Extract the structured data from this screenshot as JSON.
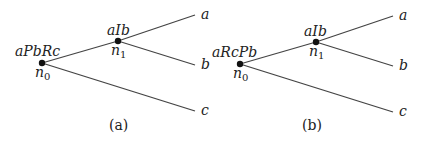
{
  "panels": [
    {
      "caption": "(a)",
      "root": {
        "name": "n",
        "sub": "0",
        "label": "aPbRc"
      },
      "inner": {
        "name": "n",
        "sub": "1",
        "label": "aIb"
      },
      "leaves": [
        "a",
        "b",
        "c"
      ]
    },
    {
      "caption": "(b)",
      "root": {
        "name": "n",
        "sub": "0",
        "label": "aRcPb"
      },
      "inner": {
        "name": "n",
        "sub": "1",
        "label": "aIb"
      },
      "leaves": [
        "a",
        "b",
        "c"
      ]
    }
  ]
}
